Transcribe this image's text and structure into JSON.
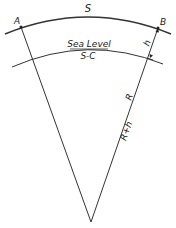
{
  "diagram": {
    "labels": {
      "arc_outer": "S",
      "point_a": "A",
      "point_b": "B",
      "sea_level": "Sea Level",
      "arc_inner": "S-C",
      "height": "h",
      "radius": "R",
      "radius_plus_height": "R+h"
    },
    "colors": {
      "line": "#333333",
      "text": "#222222",
      "background": "#ffffff"
    }
  }
}
